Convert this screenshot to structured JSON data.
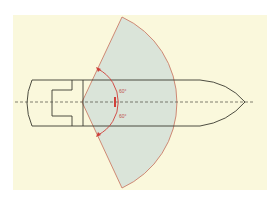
{
  "diagram": {
    "colors": {
      "page_background": "#ffffff",
      "panel_background": "#faf8dc",
      "sector_fill": "#d4e0d8",
      "sector_stroke": "#c8705a",
      "hull_stroke": "#3a3a30",
      "centerline": "#4a4a40",
      "angle_arc": "#d0403a"
    },
    "angle_labels": {
      "upper": "60°",
      "lower": "60°"
    }
  }
}
